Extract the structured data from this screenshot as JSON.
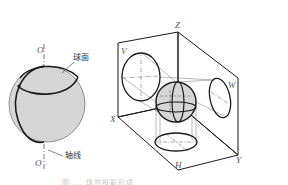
{
  "figure": {
    "left": {
      "title": "sphere-of-revolution",
      "labels": {
        "axis_top": "O",
        "axis_bottom": "O",
        "surface": "球面",
        "axis": "轴线"
      }
    },
    "right": {
      "title": "sphere-three-view-projection",
      "labels": {
        "z_axis": "Z",
        "x_axis": "X",
        "y_axis": "Y",
        "v_plane": "V",
        "w_plane": "W",
        "h_plane": "H"
      }
    },
    "caption": "图 ... 球的投影形成"
  },
  "colors": {
    "line": "#1a1a1a",
    "thin_line": "#666666",
    "sphere_fill": "#d6d6d6",
    "label": "#555555"
  }
}
